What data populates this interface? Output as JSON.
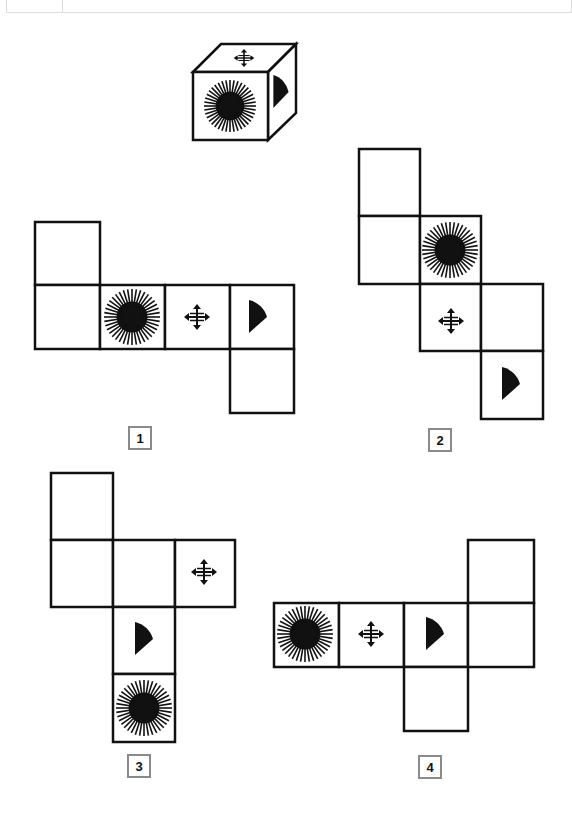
{
  "puzzle": {
    "question_cube": {
      "front_face": "sunburst",
      "top_face": "four-way-arrow",
      "right_face": "quarter-wedge"
    },
    "options": [
      {
        "label": "1",
        "faces": [
          "blank",
          "blank",
          "sunburst",
          "four-way-arrow",
          "quarter-wedge",
          "blank"
        ]
      },
      {
        "label": "2",
        "faces": [
          "blank",
          "blank",
          "sunburst",
          "four-way-arrow",
          "blank",
          "quarter-wedge"
        ]
      },
      {
        "label": "3",
        "faces": [
          "blank",
          "blank",
          "blank",
          "four-way-arrow",
          "quarter-wedge",
          "sunburst"
        ]
      },
      {
        "label": "4",
        "faces": [
          "sunburst",
          "four-way-arrow",
          "quarter-wedge",
          "blank",
          "blank",
          "blank"
        ]
      }
    ],
    "colors": {
      "ink": "#111111",
      "label_border": "#8a8a8a",
      "background": "#ffffff"
    }
  }
}
